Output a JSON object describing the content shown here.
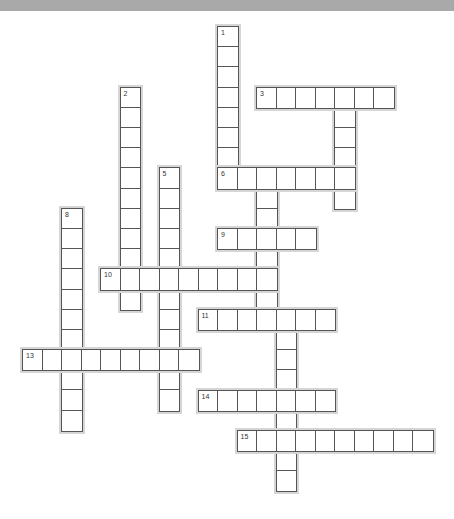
{
  "puzzle": {
    "cell_w": 19.5,
    "cell_h": 20.2,
    "colors": {
      "banner": "#a9a9a9",
      "border": "#555555",
      "halo": "#d6d6d6",
      "cell": "#ffffff"
    },
    "entries": [
      {
        "number": "1",
        "direction": "down",
        "row": 0,
        "col": 10,
        "length": 8
      },
      {
        "number": "2",
        "direction": "down",
        "row": 3,
        "col": 5,
        "length": 11
      },
      {
        "number": "3",
        "direction": "across",
        "row": 3,
        "col": 12,
        "length": 7
      },
      {
        "number": "4",
        "direction": "down",
        "row": 3,
        "col": 16,
        "length": 6
      },
      {
        "number": "5",
        "direction": "down",
        "row": 7,
        "col": 7,
        "length": 12
      },
      {
        "number": "6",
        "direction": "across",
        "row": 7,
        "col": 10,
        "length": 7
      },
      {
        "number": "7",
        "direction": "down",
        "row": 7,
        "col": 12,
        "length": 8
      },
      {
        "number": "8",
        "direction": "down",
        "row": 9,
        "col": 2,
        "length": 11
      },
      {
        "number": "9",
        "direction": "across",
        "row": 10,
        "col": 10,
        "length": 5
      },
      {
        "number": "10",
        "direction": "across",
        "row": 12,
        "col": 4,
        "length": 9
      },
      {
        "number": "11",
        "direction": "across",
        "row": 14,
        "col": 9,
        "length": 7
      },
      {
        "number": "12",
        "direction": "down",
        "row": 14,
        "col": 13,
        "length": 9
      },
      {
        "number": "13",
        "direction": "across",
        "row": 16,
        "col": 0,
        "length": 9
      },
      {
        "number": "14",
        "direction": "across",
        "row": 18,
        "col": 9,
        "length": 7
      },
      {
        "number": "15",
        "direction": "across",
        "row": 20,
        "col": 11,
        "length": 10
      }
    ]
  }
}
